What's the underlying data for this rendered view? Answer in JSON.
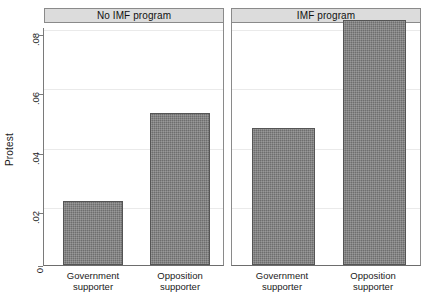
{
  "chart_data": {
    "type": "bar",
    "title": "",
    "subtitle": "",
    "xlabel": "",
    "ylabel": "Protest",
    "ylim": [
      0,
      0.085
    ],
    "ytick_values": [
      0,
      0.02,
      0.04,
      0.06,
      0.08
    ],
    "ytick_labels": [
      "0",
      ".02",
      ".04",
      ".06",
      ".08"
    ],
    "grid": true,
    "legend": "none",
    "categories": [
      "Government supporter",
      "Opposition supporter"
    ],
    "panels": [
      {
        "label": "No IMF program",
        "categories": [
          "Government supporter",
          "Opposition supporter"
        ],
        "values": [
          0.021,
          0.05
        ]
      },
      {
        "label": "IMF program",
        "categories": [
          "Government supporter",
          "Opposition supporter"
        ],
        "values": [
          0.045,
          0.0805
        ]
      }
    ],
    "series": [
      {
        "name": "No IMF program",
        "values": [
          0.021,
          0.05
        ]
      },
      {
        "name": "IMF program",
        "values": [
          0.045,
          0.0805
        ]
      }
    ],
    "colors": {
      "bar_fill": "#6e6e6e",
      "bar_edge": "#555555",
      "panel_title_bg": "#dcdcdc",
      "grid": "#eaeaea",
      "axis": "#7a7a7a",
      "background": "#ffffff"
    }
  },
  "axis": {
    "y_title": "Protest",
    "ticks": [
      {
        "label": ".08",
        "value": 0.08
      },
      {
        "label": ".06",
        "value": 0.06
      },
      {
        "label": ".04",
        "value": 0.04
      },
      {
        "label": ".02",
        "value": 0.02
      },
      {
        "label": "0",
        "value": 0
      }
    ]
  },
  "panels": [
    {
      "title": "No IMF program",
      "bars": [
        {
          "cat_line1": "Government",
          "cat_line2": "supporter",
          "value": 0.021
        },
        {
          "cat_line1": "Opposition",
          "cat_line2": "supporter",
          "value": 0.05
        }
      ]
    },
    {
      "title": "IMF program",
      "bars": [
        {
          "cat_line1": "Government",
          "cat_line2": "supporter",
          "value": 0.045
        },
        {
          "cat_line1": "Opposition",
          "cat_line2": "supporter",
          "value": 0.0805
        }
      ]
    }
  ]
}
